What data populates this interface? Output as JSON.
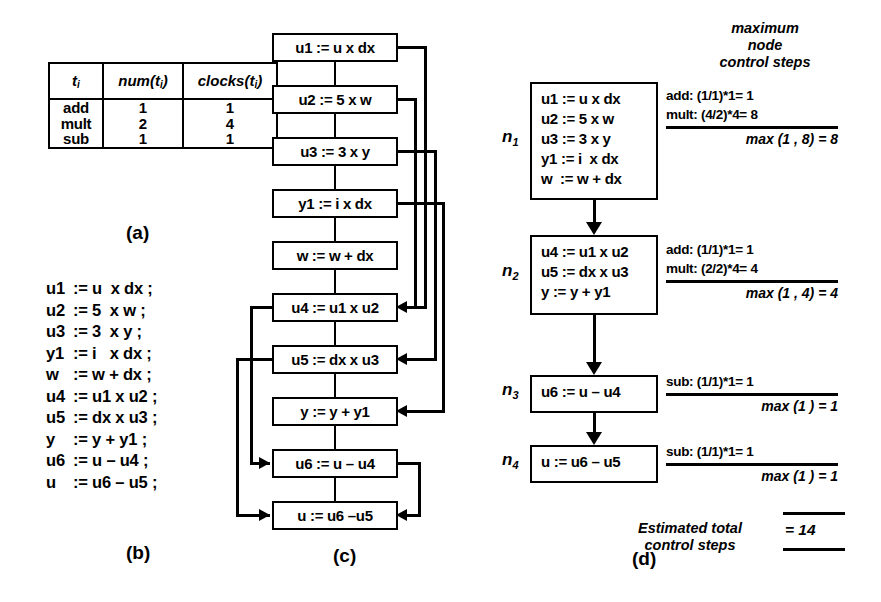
{
  "panel_a": {
    "caption": "(a)",
    "headers": [
      "t",
      "num(t",
      "clocks(t"
    ],
    "header_display": [
      {
        "main": "t",
        "sub": "i"
      },
      {
        "main": "num(t",
        "sub": "i",
        "close": ")"
      },
      {
        "main": "clocks(t",
        "sub": "i",
        "close": ")"
      }
    ],
    "operations": [
      "add",
      "mult",
      "sub"
    ],
    "num": [
      "1",
      "2",
      "1"
    ],
    "clocks": [
      "1",
      "4",
      "1"
    ]
  },
  "panel_b": {
    "caption": "(b)",
    "lines": [
      {
        "lhs": "u1",
        "rest": ":= u  x dx ;"
      },
      {
        "lhs": "u2",
        "rest": ":= 5  x w ;"
      },
      {
        "lhs": "u3",
        "rest": ":= 3  x y ;"
      },
      {
        "lhs": "y1",
        "rest": ":= i   x dx ;"
      },
      {
        "lhs": "w",
        "rest": ":= w + dx ;"
      },
      {
        "lhs": "u4",
        "rest": ":= u1 x u2 ;"
      },
      {
        "lhs": "u5",
        "rest": ":= dx x u3 ;"
      },
      {
        "lhs": "y",
        "rest": ":= y + y1 ;"
      },
      {
        "lhs": "u6",
        "rest": ":= u – u4 ;"
      },
      {
        "lhs": "u",
        "rest": ":= u6 – u5 ;"
      }
    ]
  },
  "panel_c": {
    "caption": "(c)",
    "nodes": [
      "u1 := u x dx",
      "u2 := 5 x w",
      "u3 := 3 x y",
      "y1 := i x dx",
      "w := w + dx",
      "u4 := u1 x u2",
      "u5 := dx x u3",
      "y := y + y1",
      "u6 := u – u4",
      "u := u6 –u5"
    ]
  },
  "panel_d": {
    "caption": "(d)",
    "header": [
      "maximum",
      "node",
      "control steps"
    ],
    "nodes": [
      {
        "label": "n",
        "sublabel": "1",
        "statements": [
          "u1 := u x dx",
          "u2 := 5 x w",
          "u3 := 3 x y",
          "y1 := i  x dx",
          "w  := w + dx"
        ],
        "annot_lines": [
          "add: (1/1)*1= 1",
          "mult: (4/2)*4= 8"
        ],
        "max": "max (1 , 8) = 8"
      },
      {
        "label": "n",
        "sublabel": "2",
        "statements": [
          "u4 := u1 x u2",
          "u5 := dx x u3",
          "y := y + y1"
        ],
        "annot_lines": [
          "add: (1/1)*1= 1",
          "mult: (2/2)*4= 4"
        ],
        "max": "max (1 , 4) = 4"
      },
      {
        "label": "n",
        "sublabel": "3",
        "statements": [
          "u6 := u – u4"
        ],
        "annot_lines": [
          "sub: (1/1)*1= 1"
        ],
        "max": "max (1 ) = 1"
      },
      {
        "label": "n",
        "sublabel": "4",
        "statements": [
          "u := u6 – u5"
        ],
        "annot_lines": [
          "sub: (1/1)*1= 1"
        ],
        "max": "max (1 ) = 1"
      }
    ],
    "total_label_1": "Estimated  total",
    "total_label_2": "control steps",
    "total_value": "= 14"
  }
}
